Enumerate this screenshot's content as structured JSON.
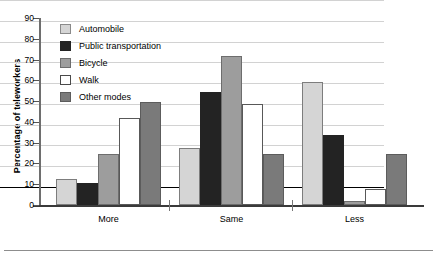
{
  "chart_data": {
    "type": "bar",
    "title": "",
    "xlabel": "",
    "ylabel": "Percentage of teleworkers",
    "ylim": [
      0,
      90
    ],
    "yticks": [
      0,
      10,
      20,
      30,
      40,
      50,
      60,
      70,
      80,
      90
    ],
    "grid": true,
    "legend_position": "upper-left-inside",
    "categories": [
      "More",
      "Same",
      "Less"
    ],
    "series": [
      {
        "name": "Automobile",
        "color": "#d5d5d5",
        "values": [
          12.5,
          27.5,
          59.0
        ]
      },
      {
        "name": "Public transportation",
        "color": "#232323",
        "values": [
          10.5,
          54.5,
          33.5
        ]
      },
      {
        "name": "Bicycle",
        "color": "#9d9d9d",
        "values": [
          24.5,
          71.5,
          2.0
        ]
      },
      {
        "name": "Walk",
        "color": "#ffffff",
        "values": [
          42.0,
          48.5,
          7.5
        ]
      },
      {
        "name": "Other modes",
        "color": "#7a7a7a",
        "values": [
          49.5,
          24.5,
          24.5
        ]
      }
    ]
  },
  "axis": {
    "y_title": "Percentage of teleworkers"
  },
  "colors": {
    "gridline": "#d2d2d2",
    "axis": "#3a3a3a",
    "background": "#ffffff"
  }
}
